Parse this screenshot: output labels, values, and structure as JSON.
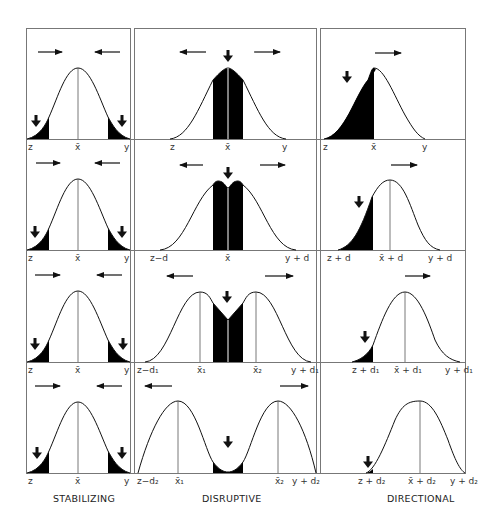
{
  "figure": {
    "columns": [
      {
        "id": "stabilizing",
        "title": "STABILIZING"
      },
      {
        "id": "disruptive",
        "title": "DISRUPTIVE"
      },
      {
        "id": "directional",
        "title": "DIRECTIONAL"
      }
    ],
    "panels": {
      "stabilizing": [
        {
          "labels": [
            "z",
            "x̄",
            "y"
          ]
        },
        {
          "labels": [
            "z",
            "x̄",
            "y"
          ]
        },
        {
          "labels": [
            "z",
            "x̄",
            "y"
          ]
        },
        {
          "labels": [
            "z",
            "x̄",
            "y"
          ]
        }
      ],
      "disruptive": [
        {
          "labels": [
            "z",
            "x̄",
            "y"
          ]
        },
        {
          "labels": [
            "z−d",
            "x̄",
            "y + d"
          ]
        },
        {
          "labels": [
            "z−d₁",
            "x̄₁",
            "x̄₂",
            "y + d₁"
          ]
        },
        {
          "labels": [
            "z−d₂",
            "x̄₁",
            "x̄₂",
            "y + d₂"
          ]
        }
      ],
      "directional": [
        {
          "labels": [
            "z",
            "x̄",
            "y"
          ]
        },
        {
          "labels": [
            "z + d",
            "x̄ + d",
            "y + d"
          ]
        },
        {
          "labels": [
            "z + d₁",
            "x̄ + d₁",
            "y + d₁"
          ]
        },
        {
          "labels": [
            "z + d₂",
            "x̄ + d₂",
            "y + d₂"
          ]
        }
      ]
    },
    "colors": {
      "ink": "#111111",
      "frame": "#777777",
      "fill": "#000000"
    }
  }
}
